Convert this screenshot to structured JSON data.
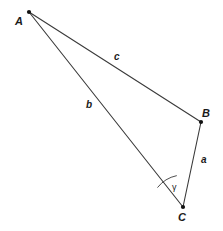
{
  "figure": {
    "type": "geometry-diagram",
    "background_color": "#ffffff",
    "stroke_color": "#3a3a3a",
    "text_color": "#1a1a1a",
    "width": 223,
    "height": 231
  },
  "vertices": [
    {
      "name": "A",
      "label": "A",
      "x": 29,
      "y": 12
    },
    {
      "name": "B",
      "label": "B",
      "x": 201,
      "y": 122
    },
    {
      "name": "C",
      "label": "C",
      "x": 183,
      "y": 207
    }
  ],
  "sides": [
    {
      "name": "a",
      "label": "a",
      "from": "B",
      "to": "C"
    },
    {
      "name": "b",
      "label": "b",
      "from": "A",
      "to": "C"
    },
    {
      "name": "c",
      "label": "c",
      "from": "A",
      "to": "B"
    }
  ],
  "angles": [
    {
      "name": "gamma",
      "label": "γ",
      "vertex": "C",
      "arc_radius": 32
    }
  ]
}
